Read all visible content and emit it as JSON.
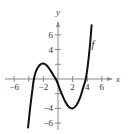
{
  "chart_data": {
    "type": "line",
    "title": "",
    "xlabel": "x",
    "ylabel": "y",
    "xlim": [
      -7,
      7
    ],
    "ylim": [
      -7,
      7
    ],
    "grid": false,
    "legend": null,
    "x_ticks": [
      -6,
      -4,
      -2,
      2,
      4,
      6
    ],
    "x_tick_labels": [
      "-6",
      "-2",
      "2",
      "4",
      "6"
    ],
    "y_ticks": [
      -6,
      -4,
      -2,
      2,
      4,
      6
    ],
    "y_tick_labels": [
      "6",
      "4",
      "-4",
      "-6"
    ],
    "series": [
      {
        "name": "f",
        "label": "f",
        "color": "#111111",
        "x": [
          -4.1,
          -3.8,
          -3.5,
          -3.3,
          -3.0,
          -2.5,
          -2.0,
          -1.5,
          -1.0,
          -0.5,
          -0.3,
          0.0,
          0.5,
          1.0,
          1.5,
          2.0,
          2.5,
          3.0,
          3.5,
          3.8,
          4.1,
          4.4,
          4.6
        ],
        "y": [
          -6.6,
          -3.8,
          -1.4,
          0.0,
          1.1,
          1.9,
          2.1,
          1.8,
          1.1,
          0.3,
          0.0,
          -0.7,
          -2.0,
          -3.1,
          -3.8,
          -4.0,
          -3.6,
          -2.6,
          -1.0,
          0.0,
          2.0,
          4.8,
          7.3
        ]
      }
    ],
    "annotations": [
      {
        "text": "f",
        "x": 4.6,
        "y": 4.6
      }
    ]
  },
  "labels": {
    "x_axis": "x",
    "y_axis": "y",
    "curve": "f"
  }
}
